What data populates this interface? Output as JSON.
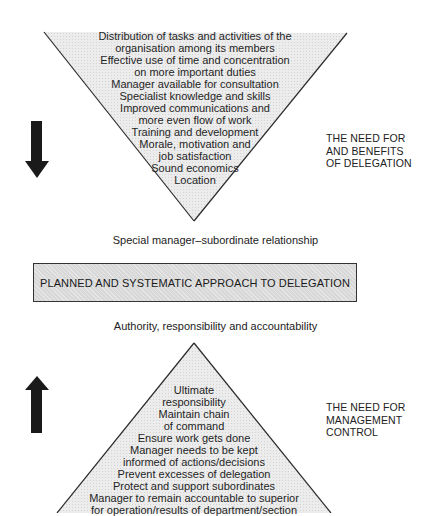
{
  "top_section": {
    "label": [
      "THE NEED FOR",
      "AND BENEFITS",
      "OF DELEGATION"
    ],
    "arrow_direction": "down",
    "items": [
      "Distribution of tasks and activities of the",
      "organisation among its members",
      "Effective use of time and concentration",
      "on more important duties",
      "Manager available for consultation",
      "Specialist knowledge and skills",
      "Improved communications and",
      "more even flow of work",
      "Training and development",
      "Morale, motivation and",
      "job satisfaction",
      "Sound economics",
      "Location"
    ]
  },
  "connector_top": "Special manager–subordinate relationship",
  "center_box": "PLANNED AND SYSTEMATIC APPROACH TO DELEGATION",
  "connector_bottom": "Authority, responsibility and accountability",
  "bottom_section": {
    "label": [
      "THE NEED FOR",
      "MANAGEMENT",
      "CONTROL"
    ],
    "arrow_direction": "up",
    "items": [
      "Ultimate",
      "responsibility",
      "Maintain chain",
      "of command",
      "Ensure work gets done",
      "Manager needs to be kept",
      "informed of actions/decisions",
      "Prevent excesses of delegation",
      "Protect and support subordinates",
      "Manager to remain accountable to superior",
      "for operation/results of department/section"
    ]
  },
  "colors": {
    "fill": "#e6e6e6",
    "box_fill": "#d8d8d8",
    "stroke": "#2a2a2a",
    "arrow": "#1a1a1a"
  }
}
